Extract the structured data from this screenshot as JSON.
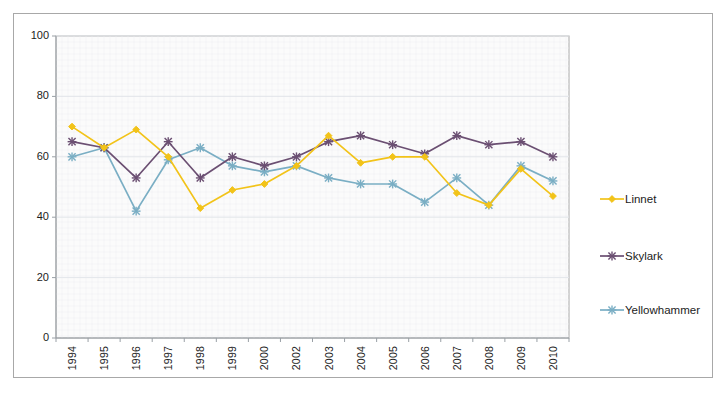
{
  "chart_data": {
    "type": "line",
    "title": "",
    "subtitle": "",
    "xlabel": "",
    "ylabel": "",
    "ylim": [
      0,
      100
    ],
    "yticks": [
      0,
      20,
      40,
      60,
      80,
      100
    ],
    "grid": true,
    "legend_position": "right",
    "categories": [
      "1994",
      "1995",
      "1996",
      "1997",
      "1998",
      "1999",
      "2000",
      "2002",
      "2003",
      "2004",
      "2005",
      "2006",
      "2007",
      "2008",
      "2009",
      "2010"
    ],
    "series": [
      {
        "name": "Linnet",
        "color": "#f2c319",
        "marker": "diamond",
        "values": [
          70,
          63,
          69,
          60,
          43,
          49,
          51,
          57,
          67,
          58,
          60,
          60,
          48,
          44,
          56,
          47
        ]
      },
      {
        "name": "Skylark",
        "color": "#6b4f72",
        "marker": "x",
        "values": [
          65,
          63,
          53,
          65,
          53,
          60,
          57,
          60,
          65,
          67,
          64,
          61,
          67,
          64,
          65,
          60
        ]
      },
      {
        "name": "Yellowhammer",
        "color": "#7aaec4",
        "marker": "x",
        "values": [
          60,
          63,
          42,
          59,
          63,
          57,
          55,
          57,
          53,
          51,
          51,
          45,
          53,
          44,
          57,
          52
        ]
      }
    ]
  },
  "plot": {
    "background_color": "#fbfbfb",
    "border_color": "#a8a8a8",
    "gridline_color": "#e3e6ea"
  }
}
